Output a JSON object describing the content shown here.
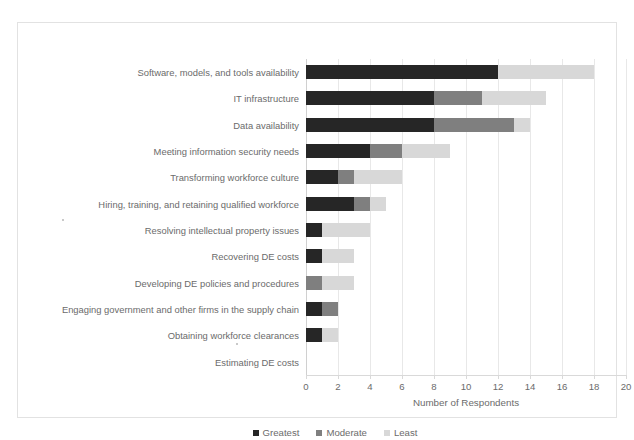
{
  "top_cut_text": "supply chain risk and mitigation strategies for digital engineering",
  "legend": {
    "position": "bottom-center",
    "items": [
      {
        "label": "Greatest",
        "color": "#262626",
        "key": "greatest"
      },
      {
        "label": "Moderate",
        "color": "#7f7f7f",
        "key": "moderate"
      },
      {
        "label": "Least",
        "color": "#d8d8d8",
        "key": "least"
      }
    ]
  },
  "axis": {
    "xlabel": "Number of Respondents",
    "ticks": [
      "0",
      "2",
      "4",
      "6",
      "8",
      "10",
      "12",
      "14",
      "16",
      "18",
      "20"
    ]
  },
  "chart_data": {
    "type": "bar",
    "orientation": "horizontal",
    "stacked": true,
    "title": "",
    "xlabel": "Number of Respondents",
    "ylabel": "",
    "xlim": [
      0,
      20
    ],
    "xtick_step": 2,
    "grid": true,
    "legend": [
      "Greatest",
      "Moderate",
      "Least"
    ],
    "legend_position": "bottom-center",
    "colors": {
      "Greatest": "#262626",
      "Moderate": "#7f7f7f",
      "Least": "#d8d8d8"
    },
    "categories": [
      "Software, models, and tools availability",
      "IT infrastructure",
      "Data availability",
      "Meeting information security needs",
      "Transforming workforce culture",
      "Hiring, training, and retaining qualified workforce",
      "Resolving intellectual property issues",
      "Recovering DE costs",
      "Developing DE policies and procedures",
      "Engaging government and other firms in the supply chain",
      "Obtaining workforce clearances",
      "Estimating DE costs"
    ],
    "series": [
      {
        "name": "Greatest",
        "values": [
          12,
          8,
          8,
          4,
          2,
          3,
          1,
          1,
          0,
          1,
          1,
          0
        ]
      },
      {
        "name": "Moderate",
        "values": [
          0,
          3,
          5,
          2,
          1,
          1,
          0,
          0,
          1,
          1,
          0,
          0
        ]
      },
      {
        "name": "Least",
        "values": [
          6,
          4,
          1,
          3,
          3,
          1,
          3,
          2,
          2,
          0,
          1,
          0
        ]
      }
    ],
    "totals": [
      18,
      15,
      14,
      9,
      6,
      5,
      4,
      3,
      3,
      2,
      2,
      0
    ]
  }
}
